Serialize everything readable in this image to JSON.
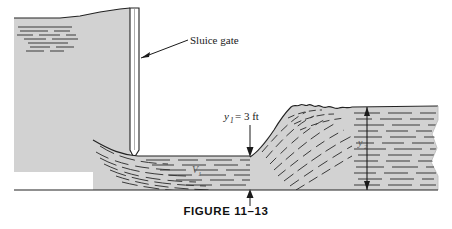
{
  "figure": {
    "caption": "FIGURE 11–13"
  },
  "colors": {
    "water_fill": "#d2d2d2",
    "water_fill_light": "#d8d8d8",
    "streamline": "#3a3a3a",
    "outline": "#222222",
    "gate_fill": "#ffffff",
    "background": "#ffffff",
    "text": "#1a1a1a"
  },
  "annotations": {
    "sluice_gate_label": "Sluice gate",
    "depth_upstream": {
      "symbol": "y",
      "subscript": "1",
      "equals": "= 3 ft",
      "full": "y₁ = 3 ft"
    },
    "velocity_upstream": {
      "symbol": "V",
      "subscript": "1"
    },
    "depth_downstream": {
      "symbol": "y",
      "subscript": "2"
    }
  },
  "elements": {
    "upstream_reservoir": "upstream-reservoir-water",
    "sluice_gate": "sluice-gate",
    "supercritical_jet": "supercritical-jet-flow",
    "hydraulic_jump": "hydraulic-jump-turbulent-crest",
    "downstream_pool": "downstream-subcritical-water",
    "channel_bed": "channel-bed-line"
  }
}
